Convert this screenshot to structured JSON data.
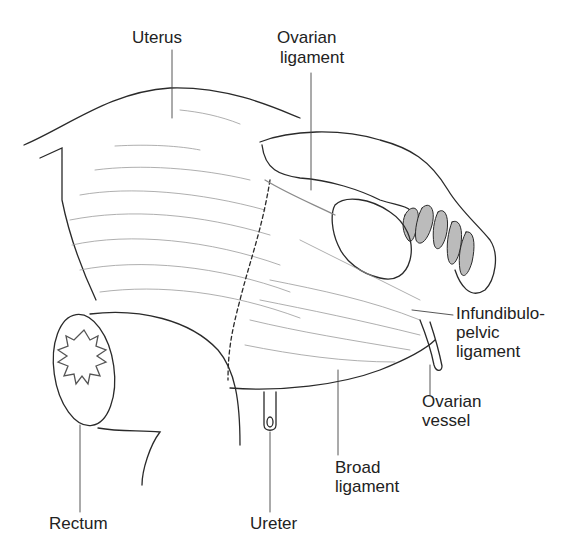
{
  "diagram": {
    "type": "anatomical-illustration",
    "style": "black line drawing on white",
    "colors": {
      "line": "#2a2a2a",
      "hatch": "#8a8a8a",
      "background": "#ffffff",
      "text": "#222222"
    },
    "labels": {
      "uterus": "Uterus",
      "ovarian_ligament_1": "Ovarian",
      "ovarian_ligament_2": "ligament",
      "infundibulopelvic_1": "Infundibulo-",
      "infundibulopelvic_2": "pelvic",
      "infundibulopelvic_3": "ligament",
      "ovarian_vessel_1": "Ovarian",
      "ovarian_vessel_2": "vessel",
      "broad_ligament_1": "Broad",
      "broad_ligament_2": "ligament",
      "rectum": "Rectum",
      "ureter": "Ureter"
    },
    "structures": [
      "uterus",
      "ovary",
      "fallopian-tube-fimbriae",
      "ovarian-ligament",
      "broad-ligament",
      "infundibulopelvic-ligament",
      "ovarian-vessel",
      "rectum",
      "ureter"
    ]
  }
}
